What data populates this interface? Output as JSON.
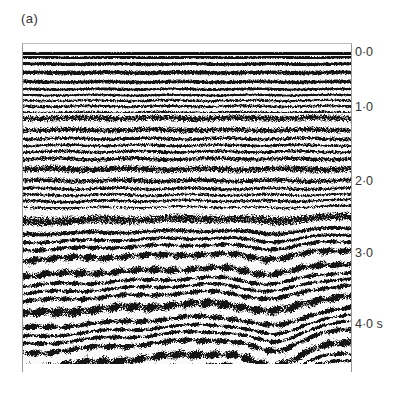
{
  "figure": {
    "panel_label": "(a)",
    "axis": {
      "label_unit": "s",
      "ticks": [
        {
          "value": 0.0,
          "label": "0·0"
        },
        {
          "value": 1.0,
          "label": "1·0"
        },
        {
          "value": 2.0,
          "label": "2·0"
        },
        {
          "value": 3.0,
          "label": "3·0"
        },
        {
          "value": 4.0,
          "label": "4·0 s"
        }
      ],
      "range": [
        0.0,
        4.4
      ]
    },
    "colors": {
      "ink": "#111111",
      "paper": "#ffffff",
      "frame": "#999999"
    }
  }
}
